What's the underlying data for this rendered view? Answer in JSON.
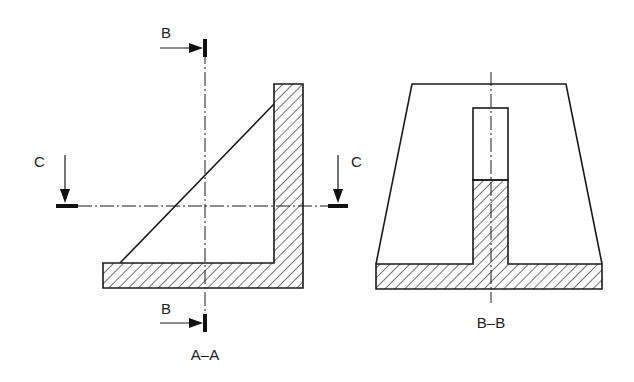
{
  "drawing": {
    "type": "technical-section-drawing",
    "colors": {
      "line": "#1a1a1a",
      "background": "#ffffff"
    },
    "views": [
      {
        "id": "A-A",
        "caption": "A–A",
        "section_markers": [
          {
            "letter": "B",
            "position": "top",
            "direction": "right"
          },
          {
            "letter": "B",
            "position": "bottom",
            "direction": "right"
          },
          {
            "letter": "C",
            "position": "left",
            "direction": "down"
          },
          {
            "letter": "C",
            "position": "right",
            "direction": "down"
          }
        ]
      },
      {
        "id": "B-B",
        "caption": "B–B"
      }
    ]
  },
  "labels": {
    "b_top": "B",
    "b_bottom": "B",
    "c_left": "C",
    "c_right": "C",
    "view_a_caption": "A–A",
    "view_b_caption": "B–B"
  }
}
